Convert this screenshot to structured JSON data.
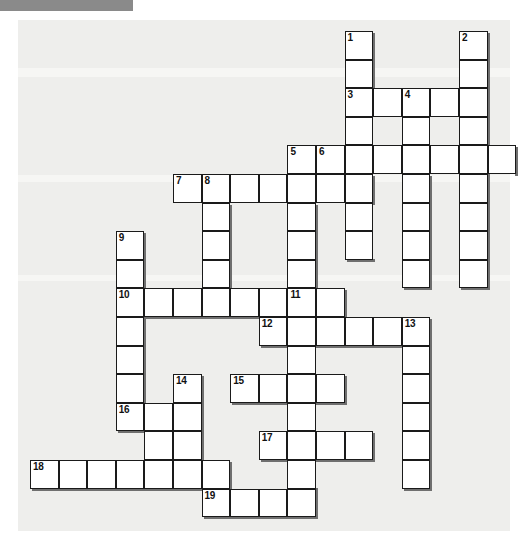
{
  "page": {
    "background_color": "#ffffff",
    "paper_color": "#eeeeec",
    "cell_color": "#ffffff",
    "grid_line_color": "#1a1a1a",
    "shadow_color": "#6f6f6f",
    "header_bar_color": "#8a8a8a"
  },
  "grid": {
    "cell_size": 28.6,
    "origin_x": 30,
    "origin_y": 31,
    "columns": 17,
    "rows": 17,
    "numbered_clue_count": 19
  },
  "entries": [
    {
      "number": "1",
      "direction": "down",
      "col": 11,
      "row": 0,
      "length": 6
    },
    {
      "number": "2",
      "direction": "down",
      "col": 15,
      "row": 0,
      "length": 9
    },
    {
      "number": "3",
      "direction": "across",
      "col": 11,
      "row": 2,
      "length": 5
    },
    {
      "number": "4",
      "direction": "down",
      "col": 13,
      "row": 2,
      "length": 7
    },
    {
      "number": "5",
      "direction": "down",
      "col": 9,
      "row": 4,
      "length": 6
    },
    {
      "number": "6",
      "direction": "across",
      "col": 10,
      "row": 4,
      "length": 7
    },
    {
      "number": "7",
      "direction": "across",
      "col": 5,
      "row": 5,
      "length": 7
    },
    {
      "number": "8",
      "direction": "down",
      "col": 6,
      "row": 5,
      "length": 6
    },
    {
      "number": "9",
      "direction": "down",
      "col": 3,
      "row": 7,
      "length": 7
    },
    {
      "number": "10",
      "direction": "across",
      "col": 3,
      "row": 9,
      "length": 8
    },
    {
      "number": "11",
      "direction": "down",
      "col": 9,
      "row": 9,
      "length": 7
    },
    {
      "number": "12",
      "direction": "across",
      "col": 8,
      "row": 10,
      "length": 6
    },
    {
      "number": "13",
      "direction": "down",
      "col": 13,
      "row": 10,
      "length": 6
    },
    {
      "number": "14",
      "direction": "down",
      "col": 5,
      "row": 12,
      "length": 3
    },
    {
      "number": "15",
      "direction": "across",
      "col": 7,
      "row": 12,
      "length": 4
    },
    {
      "number": "16",
      "direction": "across",
      "col": 3,
      "row": 13,
      "length": 4
    },
    {
      "number": "17",
      "direction": "across",
      "col": 8,
      "row": 14,
      "length": 4
    },
    {
      "number": "18",
      "direction": "across",
      "col": 0,
      "row": 15,
      "length": 7
    },
    {
      "number": "19",
      "direction": "across",
      "col": 6,
      "row": 16,
      "length": 4
    }
  ],
  "cells": [
    {
      "col": 11,
      "row": 0,
      "number": "1"
    },
    {
      "col": 15,
      "row": 0,
      "number": "2"
    },
    {
      "col": 11,
      "row": 1,
      "number": ""
    },
    {
      "col": 15,
      "row": 1,
      "number": ""
    },
    {
      "col": 11,
      "row": 2,
      "number": "3"
    },
    {
      "col": 12,
      "row": 2,
      "number": ""
    },
    {
      "col": 13,
      "row": 2,
      "number": "4"
    },
    {
      "col": 14,
      "row": 2,
      "number": ""
    },
    {
      "col": 15,
      "row": 2,
      "number": ""
    },
    {
      "col": 11,
      "row": 3,
      "number": ""
    },
    {
      "col": 13,
      "row": 3,
      "number": ""
    },
    {
      "col": 15,
      "row": 3,
      "number": ""
    },
    {
      "col": 9,
      "row": 4,
      "number": "5"
    },
    {
      "col": 10,
      "row": 4,
      "number": "6"
    },
    {
      "col": 11,
      "row": 4,
      "number": ""
    },
    {
      "col": 12,
      "row": 4,
      "number": ""
    },
    {
      "col": 13,
      "row": 4,
      "number": ""
    },
    {
      "col": 14,
      "row": 4,
      "number": ""
    },
    {
      "col": 15,
      "row": 4,
      "number": ""
    },
    {
      "col": 16,
      "row": 4,
      "number": ""
    },
    {
      "col": 5,
      "row": 5,
      "number": "7"
    },
    {
      "col": 6,
      "row": 5,
      "number": "8"
    },
    {
      "col": 7,
      "row": 5,
      "number": ""
    },
    {
      "col": 8,
      "row": 5,
      "number": ""
    },
    {
      "col": 9,
      "row": 5,
      "number": ""
    },
    {
      "col": 10,
      "row": 5,
      "number": ""
    },
    {
      "col": 11,
      "row": 5,
      "number": ""
    },
    {
      "col": 13,
      "row": 5,
      "number": ""
    },
    {
      "col": 15,
      "row": 5,
      "number": ""
    },
    {
      "col": 6,
      "row": 6,
      "number": ""
    },
    {
      "col": 9,
      "row": 6,
      "number": ""
    },
    {
      "col": 11,
      "row": 6,
      "number": ""
    },
    {
      "col": 13,
      "row": 6,
      "number": ""
    },
    {
      "col": 15,
      "row": 6,
      "number": ""
    },
    {
      "col": 3,
      "row": 7,
      "number": "9"
    },
    {
      "col": 6,
      "row": 7,
      "number": ""
    },
    {
      "col": 9,
      "row": 7,
      "number": ""
    },
    {
      "col": 11,
      "row": 7,
      "number": ""
    },
    {
      "col": 13,
      "row": 7,
      "number": ""
    },
    {
      "col": 15,
      "row": 7,
      "number": ""
    },
    {
      "col": 3,
      "row": 8,
      "number": ""
    },
    {
      "col": 6,
      "row": 8,
      "number": ""
    },
    {
      "col": 9,
      "row": 8,
      "number": ""
    },
    {
      "col": 13,
      "row": 8,
      "number": ""
    },
    {
      "col": 15,
      "row": 8,
      "number": ""
    },
    {
      "col": 3,
      "row": 9,
      "number": "10"
    },
    {
      "col": 4,
      "row": 9,
      "number": ""
    },
    {
      "col": 5,
      "row": 9,
      "number": ""
    },
    {
      "col": 6,
      "row": 9,
      "number": ""
    },
    {
      "col": 7,
      "row": 9,
      "number": ""
    },
    {
      "col": 8,
      "row": 9,
      "number": ""
    },
    {
      "col": 9,
      "row": 9,
      "number": "11"
    },
    {
      "col": 10,
      "row": 9,
      "number": ""
    },
    {
      "col": 3,
      "row": 10,
      "number": ""
    },
    {
      "col": 8,
      "row": 10,
      "number": "12"
    },
    {
      "col": 9,
      "row": 10,
      "number": ""
    },
    {
      "col": 10,
      "row": 10,
      "number": ""
    },
    {
      "col": 11,
      "row": 10,
      "number": ""
    },
    {
      "col": 12,
      "row": 10,
      "number": ""
    },
    {
      "col": 13,
      "row": 10,
      "number": "13"
    },
    {
      "col": 3,
      "row": 11,
      "number": ""
    },
    {
      "col": 9,
      "row": 11,
      "number": ""
    },
    {
      "col": 13,
      "row": 11,
      "number": ""
    },
    {
      "col": 3,
      "row": 12,
      "number": ""
    },
    {
      "col": 5,
      "row": 12,
      "number": "14"
    },
    {
      "col": 7,
      "row": 12,
      "number": "15"
    },
    {
      "col": 8,
      "row": 12,
      "number": ""
    },
    {
      "col": 9,
      "row": 12,
      "number": ""
    },
    {
      "col": 10,
      "row": 12,
      "number": ""
    },
    {
      "col": 13,
      "row": 12,
      "number": ""
    },
    {
      "col": 3,
      "row": 13,
      "number": "16"
    },
    {
      "col": 4,
      "row": 13,
      "number": ""
    },
    {
      "col": 5,
      "row": 13,
      "number": ""
    },
    {
      "col": 9,
      "row": 13,
      "number": ""
    },
    {
      "col": 13,
      "row": 13,
      "number": ""
    },
    {
      "col": 4,
      "row": 14,
      "number": ""
    },
    {
      "col": 5,
      "row": 14,
      "number": ""
    },
    {
      "col": 8,
      "row": 14,
      "number": "17"
    },
    {
      "col": 9,
      "row": 14,
      "number": ""
    },
    {
      "col": 10,
      "row": 14,
      "number": ""
    },
    {
      "col": 11,
      "row": 14,
      "number": ""
    },
    {
      "col": 13,
      "row": 14,
      "number": ""
    },
    {
      "col": 0,
      "row": 15,
      "number": "18"
    },
    {
      "col": 1,
      "row": 15,
      "number": ""
    },
    {
      "col": 2,
      "row": 15,
      "number": ""
    },
    {
      "col": 3,
      "row": 15,
      "number": ""
    },
    {
      "col": 4,
      "row": 15,
      "number": ""
    },
    {
      "col": 5,
      "row": 15,
      "number": ""
    },
    {
      "col": 6,
      "row": 15,
      "number": ""
    },
    {
      "col": 9,
      "row": 15,
      "number": ""
    },
    {
      "col": 13,
      "row": 15,
      "number": ""
    },
    {
      "col": 6,
      "row": 16,
      "number": "19"
    },
    {
      "col": 7,
      "row": 16,
      "number": ""
    },
    {
      "col": 8,
      "row": 16,
      "number": ""
    },
    {
      "col": 9,
      "row": 16,
      "number": ""
    }
  ],
  "shadows": {
    "right": [
      {
        "col": 11,
        "row": 0,
        "span": 2
      },
      {
        "col": 15,
        "row": 0,
        "span": 5
      },
      {
        "col": 15,
        "row": 2,
        "span": 3
      },
      {
        "col": 16,
        "row": 4,
        "span": 1
      },
      {
        "col": 11,
        "row": 5,
        "span": 1
      },
      {
        "col": 13,
        "row": 5,
        "span": 4
      },
      {
        "col": 15,
        "row": 5,
        "span": 4
      },
      {
        "col": 9,
        "row": 6,
        "span": 3
      },
      {
        "col": 6,
        "row": 6,
        "span": 3
      },
      {
        "col": 3,
        "row": 7,
        "span": 2
      },
      {
        "col": 10,
        "row": 9,
        "span": 1
      },
      {
        "col": 13,
        "row": 10,
        "span": 6
      },
      {
        "col": 3,
        "row": 10,
        "span": 3
      },
      {
        "col": 5,
        "row": 12,
        "span": 1
      },
      {
        "col": 10,
        "row": 12,
        "span": 1
      },
      {
        "col": 5,
        "row": 13,
        "span": 2
      },
      {
        "col": 11,
        "row": 14,
        "span": 1
      },
      {
        "col": 6,
        "row": 15,
        "span": 1
      },
      {
        "col": 9,
        "row": 16,
        "span": 1
      }
    ],
    "bottom": [
      {
        "col": 11,
        "row": 7,
        "span": 1
      },
      {
        "col": 13,
        "row": 8,
        "span": 1
      },
      {
        "col": 15,
        "row": 8,
        "span": 1
      },
      {
        "col": 9,
        "row": 8,
        "span": 1
      },
      {
        "col": 3,
        "row": 9,
        "span": 6
      },
      {
        "col": 8,
        "row": 10,
        "span": 5
      },
      {
        "col": 7,
        "row": 12,
        "span": 4
      },
      {
        "col": 3,
        "row": 13,
        "span": 3
      },
      {
        "col": 8,
        "row": 14,
        "span": 4
      },
      {
        "col": 0,
        "row": 15,
        "span": 7
      },
      {
        "col": 9,
        "row": 15,
        "span": 1
      },
      {
        "col": 13,
        "row": 15,
        "span": 1
      },
      {
        "col": 6,
        "row": 16,
        "span": 4
      },
      {
        "col": 5,
        "row": 14,
        "span": 1
      }
    ]
  }
}
